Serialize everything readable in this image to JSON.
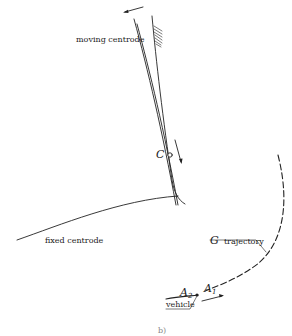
{
  "figure": {
    "panel_label": "b)",
    "labels": {
      "moving_centrode": "moving centrode",
      "fixed_centrode": "fixed centrode",
      "g_symbol": "G",
      "g_trajectory": "trajectory",
      "instant_centre": "C",
      "a2_letter": "A",
      "a2_sub": "2",
      "a1_letter": "A",
      "a1_sub": "1",
      "vehicle": "vehicle"
    },
    "colors": {
      "line": "#222222",
      "background": "#ffffff"
    }
  }
}
